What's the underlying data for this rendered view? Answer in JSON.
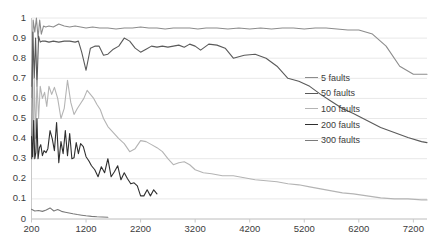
{
  "chart_data": {
    "type": "line",
    "title": "",
    "xlabel": "",
    "ylabel": "",
    "xlim": [
      200,
      7450
    ],
    "ylim": [
      0,
      1
    ],
    "grid": true,
    "grid_axis": "y",
    "legend_position": "center-right",
    "xticks": [
      "200",
      "1200",
      "2200",
      "3200",
      "4200",
      "5200",
      "6200",
      "7200"
    ],
    "xtick_values": [
      200,
      1200,
      2200,
      3200,
      4200,
      5200,
      6200,
      7200
    ],
    "yticks": [
      "0",
      "0.1",
      "0.2",
      "0.3",
      "0.4",
      "0.5",
      "0.6",
      "0.7",
      "0.8",
      "0.9",
      "1"
    ],
    "ytick_values": [
      0,
      0.1,
      0.2,
      0.3,
      0.4,
      0.5,
      0.6,
      0.7,
      0.8,
      0.9,
      1
    ],
    "series": [
      {
        "name": "5 faults",
        "color": "#8c8c8c",
        "x": [
          200,
          230,
          260,
          290,
          320,
          350,
          380,
          420,
          460,
          520,
          600,
          700,
          800,
          900,
          1000,
          1100,
          1200,
          1320,
          1450,
          1600,
          1750,
          1900,
          2050,
          2200,
          2350,
          2500,
          2650,
          2800,
          2950,
          3100,
          3250,
          3400,
          3600,
          3800,
          4000,
          4200,
          4400,
          4600,
          4800,
          5000,
          5200,
          5400,
          5600,
          5800,
          6000,
          6200,
          6450,
          6700,
          6950,
          7200,
          7450
        ],
        "y": [
          0.66,
          0.99,
          0.93,
          1.0,
          0.9,
          0.99,
          0.92,
          0.96,
          0.955,
          0.96,
          0.955,
          0.97,
          0.96,
          0.955,
          0.96,
          0.955,
          0.95,
          0.955,
          0.95,
          0.95,
          0.945,
          0.95,
          0.95,
          0.955,
          0.95,
          0.95,
          0.945,
          0.95,
          0.95,
          0.95,
          0.945,
          0.95,
          0.95,
          0.945,
          0.95,
          0.945,
          0.95,
          0.945,
          0.95,
          0.95,
          0.945,
          0.95,
          0.95,
          0.945,
          0.94,
          0.94,
          0.92,
          0.86,
          0.76,
          0.72,
          0.72
        ]
      },
      {
        "name": "50 faults",
        "color": "#5a5a5a",
        "x": [
          200,
          225,
          250,
          275,
          300,
          330,
          360,
          400,
          450,
          520,
          600,
          700,
          800,
          900,
          1000,
          1060,
          1120,
          1200,
          1280,
          1360,
          1440,
          1520,
          1600,
          1700,
          1800,
          1900,
          2000,
          2100,
          2200,
          2300,
          2400,
          2500,
          2600,
          2700,
          2800,
          2900,
          3000,
          3100,
          3200,
          3300,
          3450,
          3600,
          3750,
          3900,
          4100,
          4300,
          4500,
          4700,
          4900,
          5100,
          5300,
          5500,
          5700,
          5900,
          6100,
          6350,
          6600,
          6850,
          7100,
          7350,
          7450
        ],
        "y": [
          0.3,
          0.93,
          0.7,
          0.9,
          0.66,
          0.91,
          0.88,
          0.885,
          0.885,
          0.88,
          0.885,
          0.88,
          0.885,
          0.885,
          0.88,
          0.885,
          0.83,
          0.74,
          0.85,
          0.86,
          0.86,
          0.815,
          0.82,
          0.845,
          0.86,
          0.9,
          0.885,
          0.85,
          0.83,
          0.845,
          0.86,
          0.855,
          0.86,
          0.855,
          0.86,
          0.865,
          0.855,
          0.87,
          0.86,
          0.84,
          0.87,
          0.865,
          0.85,
          0.8,
          0.815,
          0.82,
          0.8,
          0.76,
          0.7,
          0.685,
          0.66,
          0.62,
          0.585,
          0.55,
          0.525,
          0.49,
          0.455,
          0.43,
          0.405,
          0.385,
          0.38
        ]
      },
      {
        "name": "100 faults",
        "color": "#b4b4b4",
        "x": [
          200,
          225,
          250,
          275,
          300,
          330,
          360,
          400,
          440,
          480,
          520,
          570,
          620,
          680,
          740,
          800,
          860,
          920,
          980,
          1040,
          1100,
          1160,
          1220,
          1280,
          1340,
          1400,
          1460,
          1520,
          1600,
          1700,
          1800,
          1900,
          2000,
          2100,
          2200,
          2300,
          2400,
          2500,
          2600,
          2700,
          2800,
          2900,
          3000,
          3100,
          3200,
          3350,
          3500,
          3700,
          3900,
          4100,
          4300,
          4500,
          4700,
          4900,
          5100,
          5300,
          5500,
          5700,
          5900,
          6100,
          6350,
          6600,
          6850,
          7100,
          7350,
          7450
        ],
        "y": [
          0.6,
          0.3,
          0.7,
          0.4,
          0.69,
          0.5,
          0.66,
          0.6,
          0.63,
          0.56,
          0.66,
          0.62,
          0.655,
          0.6,
          0.5,
          0.55,
          0.69,
          0.58,
          0.52,
          0.55,
          0.575,
          0.6,
          0.64,
          0.62,
          0.6,
          0.57,
          0.545,
          0.5,
          0.46,
          0.43,
          0.4,
          0.375,
          0.335,
          0.35,
          0.39,
          0.385,
          0.37,
          0.355,
          0.335,
          0.3,
          0.27,
          0.28,
          0.285,
          0.27,
          0.245,
          0.23,
          0.225,
          0.215,
          0.215,
          0.205,
          0.195,
          0.19,
          0.185,
          0.175,
          0.17,
          0.16,
          0.15,
          0.14,
          0.13,
          0.125,
          0.115,
          0.105,
          0.1,
          0.1,
          0.095,
          0.095
        ]
      },
      {
        "name": "200 faults",
        "color": "#2f2f2f",
        "x": [
          200,
          220,
          240,
          260,
          280,
          300,
          320,
          345,
          370,
          400,
          430,
          465,
          500,
          540,
          580,
          620,
          660,
          700,
          740,
          780,
          820,
          860,
          900,
          940,
          980,
          1020,
          1060,
          1100,
          1150,
          1200,
          1250,
          1300,
          1360,
          1420,
          1480,
          1540,
          1600,
          1660,
          1720,
          1780,
          1840,
          1900,
          1960,
          2020,
          2080,
          2140,
          2200,
          2260,
          2320,
          2380,
          2440,
          2500
        ],
        "y": [
          0.41,
          0.31,
          0.49,
          0.3,
          0.33,
          0.5,
          0.3,
          0.355,
          0.37,
          0.315,
          0.34,
          0.33,
          0.35,
          0.44,
          0.4,
          0.34,
          0.48,
          0.28,
          0.385,
          0.325,
          0.44,
          0.315,
          0.425,
          0.3,
          0.305,
          0.38,
          0.325,
          0.375,
          0.36,
          0.31,
          0.29,
          0.265,
          0.245,
          0.21,
          0.26,
          0.23,
          0.3,
          0.21,
          0.235,
          0.265,
          0.195,
          0.23,
          0.2,
          0.175,
          0.18,
          0.165,
          0.115,
          0.115,
          0.145,
          0.115,
          0.145,
          0.125
        ]
      },
      {
        "name": "300 faults",
        "color": "#7a7a7a",
        "x": [
          200,
          260,
          330,
          400,
          470,
          540,
          610,
          680,
          750,
          820,
          890,
          960,
          1040,
          1120,
          1200,
          1300,
          1400,
          1500,
          1600
        ],
        "y": [
          0.048,
          0.04,
          0.042,
          0.038,
          0.045,
          0.055,
          0.04,
          0.047,
          0.038,
          0.034,
          0.03,
          0.026,
          0.022,
          0.019,
          0.016,
          0.013,
          0.011,
          0.01,
          0.009
        ]
      }
    ],
    "legend_entries": [
      {
        "label": "5 faults",
        "color": "#8c8c8c"
      },
      {
        "label": "50 faults",
        "color": "#5a5a5a"
      },
      {
        "label": "100 faults",
        "color": "#b4b4b4"
      },
      {
        "label": "200 faults",
        "color": "#2f2f2f"
      },
      {
        "label": "300 faults",
        "color": "#7a7a7a"
      }
    ]
  },
  "style": {
    "grid_color": "#e8e8e8",
    "axis_color": "#c8c8c8",
    "text_color": "#3c3c3c",
    "background": "#ffffff"
  }
}
